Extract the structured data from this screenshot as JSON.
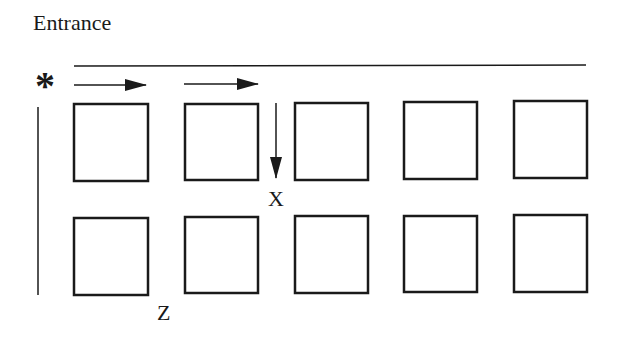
{
  "title": "Entrance",
  "start_marker": "*",
  "labels": {
    "x": "X",
    "z": "Z"
  },
  "grid": {
    "rows": 2,
    "cols": 5
  },
  "colors": {
    "stroke": "#1a1a1a",
    "background": "#ffffff"
  }
}
